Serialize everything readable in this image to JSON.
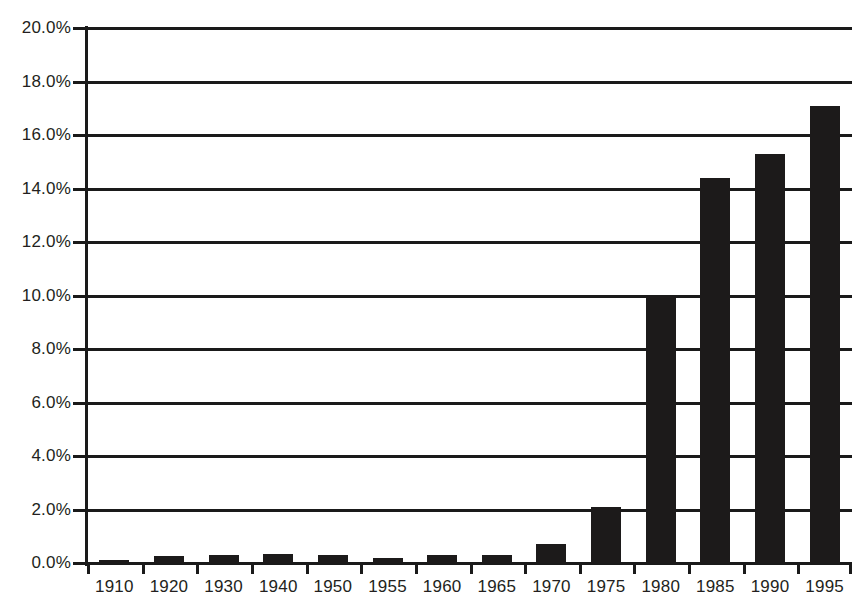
{
  "chart_data": {
    "type": "bar",
    "title": "",
    "subtitle": "",
    "xlabel": "",
    "ylabel": "",
    "categories": [
      "1910",
      "1920",
      "1930",
      "1940",
      "1950",
      "1955",
      "1960",
      "1965",
      "1970",
      "1975",
      "1980",
      "1985",
      "1990",
      "1995"
    ],
    "values": [
      0.1,
      0.25,
      0.3,
      0.35,
      0.3,
      0.2,
      0.3,
      0.3,
      0.7,
      2.1,
      10.0,
      14.4,
      15.3,
      17.1
    ],
    "series": [
      {
        "name": "",
        "values": [
          0.1,
          0.25,
          0.3,
          0.35,
          0.3,
          0.2,
          0.3,
          0.3,
          0.7,
          2.1,
          10.0,
          14.4,
          15.3,
          17.1
        ]
      }
    ],
    "ylim": [
      0,
      20
    ],
    "ytick_values": [
      0,
      2,
      4,
      6,
      8,
      10,
      12,
      14,
      16,
      18,
      20
    ],
    "ytick_labels": [
      "0.0%",
      "2.0%",
      "4.0%",
      "6.0%",
      "8.0%",
      "10.0%",
      "12.0%",
      "14.0%",
      "16.0%",
      "18.0%",
      "20.0%"
    ],
    "grid": true,
    "grid_axis": "y",
    "legend": false,
    "legend_position": "none",
    "bar_color": "#1c1a1a",
    "axis_color": "#1a1a1a",
    "background_color": "#ffffff",
    "value_format": "percent",
    "annotations": []
  },
  "colors": {
    "bar": "#1c1a1a",
    "axis": "#1a1a1a",
    "text": "#231f20",
    "background": "#ffffff"
  }
}
